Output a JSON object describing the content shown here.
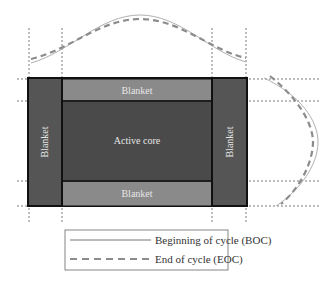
{
  "diagram": {
    "regions": {
      "blanket_top": "Blanket",
      "blanket_bottom": "Blanket",
      "blanket_left": "Blanket",
      "blanket_right": "Blanket",
      "active_core": "Active core"
    },
    "legend": {
      "boc_label": "Beginning of cycle (BOC)",
      "eoc_label": "End of cycle (EOC)"
    },
    "colors": {
      "blanket_side": "#555555",
      "blanket_top_bottom": "#8a8a8a",
      "active_core": "#4a4a4a",
      "outline": "#111111",
      "boc_line": "#b0b0b0",
      "eoc_line": "#8c8c8c"
    }
  }
}
